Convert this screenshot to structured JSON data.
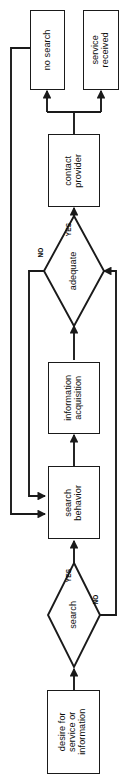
{
  "diagram": {
    "orientation": "rotated-90-ccw",
    "stroke_color": "#1a1a1a",
    "text_color": "#0d0d0d",
    "background_color": "#ffffff",
    "nodes": [
      {
        "id": "no_search",
        "shape": "box",
        "label": "no search"
      },
      {
        "id": "service_received",
        "shape": "box",
        "label": "service\nreceived"
      },
      {
        "id": "contact_provider",
        "shape": "box",
        "label": "contact\nprovider"
      },
      {
        "id": "adequate",
        "shape": "diamond",
        "label": "adequate"
      },
      {
        "id": "information_acquisition",
        "shape": "box",
        "label": "information\nacquisition"
      },
      {
        "id": "search_behavior",
        "shape": "box",
        "label": "search\nbehavior"
      },
      {
        "id": "search",
        "shape": "diamond",
        "label": "search"
      },
      {
        "id": "desire",
        "shape": "box",
        "label": "desire for\nservice or\ninformation"
      }
    ],
    "edge_labels": {
      "adequate_yes": "YES",
      "adequate_no": "NO",
      "search_yes": "YES",
      "search_no": "NO"
    },
    "edges": [
      {
        "from": "desire",
        "to": "search",
        "label": ""
      },
      {
        "from": "search",
        "to": "search_behavior",
        "label": "YES"
      },
      {
        "from": "search",
        "to": "adequate",
        "label": "NO"
      },
      {
        "from": "search_behavior",
        "to": "information_acquisition",
        "label": ""
      },
      {
        "from": "information_acquisition",
        "to": "adequate",
        "label": ""
      },
      {
        "from": "adequate",
        "to": "contact_provider",
        "label": "YES"
      },
      {
        "from": "adequate",
        "to": "search_behavior",
        "label": "NO"
      },
      {
        "from": "contact_provider",
        "to": "no_search",
        "label": ""
      },
      {
        "from": "contact_provider",
        "to": "service_received",
        "label": ""
      },
      {
        "from": "no_search",
        "to": "search_behavior",
        "label": ""
      }
    ]
  }
}
